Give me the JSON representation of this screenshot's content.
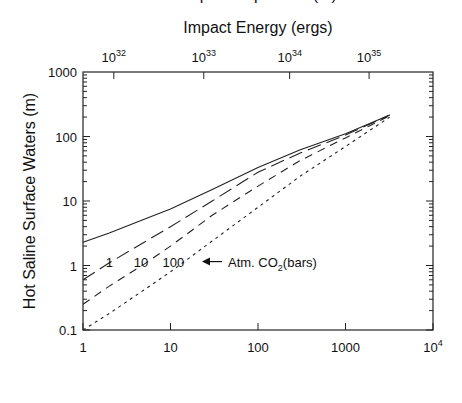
{
  "chart_data": {
    "type": "line",
    "title": "",
    "top_axis": {
      "label": "Impact Energy (ergs)",
      "ticks": [
        {
          "base": "10",
          "exp": "32",
          "x_depth": 2.25
        },
        {
          "base": "10",
          "exp": "33",
          "x_depth": 24
        },
        {
          "base": "10",
          "exp": "34",
          "x_depth": 230
        },
        {
          "base": "10",
          "exp": "35",
          "x_depth": 1860
        }
      ]
    },
    "xlabel": "Depth Evaporated (m)",
    "ylabel": "Hot Saline Surface Waters (m)",
    "xscale": "log",
    "yscale": "log",
    "xlim": [
      1,
      10000
    ],
    "ylim": [
      0.1,
      1000
    ],
    "x_ticks": [
      {
        "v": 1,
        "label": "1"
      },
      {
        "v": 10,
        "label": "10"
      },
      {
        "v": 100,
        "label": "100"
      },
      {
        "v": 1000,
        "label": "1000"
      },
      {
        "v": 10000,
        "label": "10",
        "exp": "4"
      }
    ],
    "y_ticks": [
      {
        "v": 0.1,
        "label": "0.1"
      },
      {
        "v": 1,
        "label": "1"
      },
      {
        "v": 10,
        "label": "10"
      },
      {
        "v": 100,
        "label": "100"
      },
      {
        "v": 1000,
        "label": "1000"
      }
    ],
    "grid": false,
    "series": [
      {
        "name": "1",
        "style": "solid",
        "x": [
          1,
          2,
          5,
          10,
          30,
          100,
          300,
          1000,
          3200
        ],
        "values": [
          2.3,
          3.2,
          5.2,
          7.5,
          15,
          33,
          62,
          110,
          215
        ]
      },
      {
        "name": "10",
        "style": "longdash",
        "x": [
          1,
          2,
          5,
          10,
          30,
          100,
          300,
          1000,
          3200
        ],
        "values": [
          0.6,
          1.1,
          2.3,
          4,
          10,
          28,
          55,
          105,
          215
        ]
      },
      {
        "name": "100",
        "style": "dash",
        "x": [
          1,
          2,
          5,
          10,
          30,
          100,
          300,
          1000,
          3200
        ],
        "values": [
          0.25,
          0.48,
          1.05,
          2,
          6,
          17,
          42,
          95,
          210
        ]
      },
      {
        "name": "dotted",
        "style": "dot",
        "x": [
          1,
          2,
          5,
          10,
          30,
          100,
          300,
          1000,
          3200
        ],
        "values": [
          0.1,
          0.18,
          0.42,
          0.8,
          2.4,
          8,
          24,
          70,
          200
        ]
      }
    ],
    "annotations": {
      "curve_labels": [
        {
          "text": "1",
          "x_depth": 2.0,
          "y": 1.15
        },
        {
          "text": "10",
          "x_depth": 4.6,
          "y": 1.15
        },
        {
          "text": "100",
          "x_depth": 10.8,
          "y": 1.15
        }
      ],
      "arrow_text": "Atm. CO",
      "arrow_sub": "2",
      "arrow_suffix": "(bars)"
    }
  }
}
